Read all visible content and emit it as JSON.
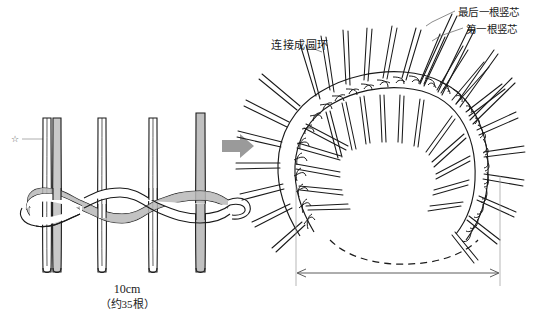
{
  "figure": {
    "background": "#ffffff",
    "ink": "#1a1a1a",
    "cord_shade": "#a9a9a9",
    "arrow_color": "#9a9a9a"
  },
  "left_panel": {
    "name": "flat-weave-step",
    "marker_glyph": "☆",
    "marker_meaning": "star-marker",
    "vertical_stakes": 4,
    "highlighted_stake_index": 4,
    "weaver_rows": 2,
    "cord_tip_style": "rounded"
  },
  "transition": {
    "arrow_glyph": "➡",
    "arrow_name": "right-arrow",
    "color": "#9a9a9a"
  },
  "right_panel": {
    "name": "ring-assembly-step",
    "labels": {
      "connect_ring": "连接成圆环",
      "last_core": "最后一根竖芯",
      "first_core": "第一根竖芯"
    },
    "dimension": {
      "value": "10cm",
      "count": "（约35根）",
      "x_start": 296,
      "x_end": 500,
      "y": 273
    },
    "dashed_arc": true,
    "spokes": 30
  }
}
